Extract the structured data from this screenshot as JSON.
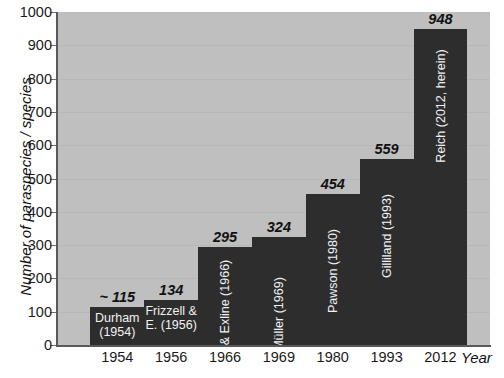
{
  "chart_data": {
    "type": "bar",
    "title": "",
    "xlabel": "Year",
    "ylabel": "Number of paraspecies / species",
    "categories": [
      "1954",
      "1956",
      "1966",
      "1969",
      "1980",
      "1993",
      "2012"
    ],
    "values": [
      115,
      134,
      295,
      324,
      454,
      559,
      948
    ],
    "value_labels": [
      "~ 115",
      "134",
      "295",
      "324",
      "454",
      "559",
      "948"
    ],
    "bar_labels": [
      "Durham (1954)",
      "Frizzell & E. (1956)",
      "Frizzell & Exline (1966)",
      "Müller (1969)",
      "Pawson (1980)",
      "Gilliland (1993)",
      "Reich (2012, herein)"
    ],
    "bar_label_lines": [
      [
        "Durham",
        "(1954)"
      ],
      [
        "Frizzell &",
        "E. (1956)"
      ],
      [
        "Frizzell & Exline",
        "(1966)"
      ],
      [
        "Müller (1969)"
      ],
      [
        "Pawson (1980)"
      ],
      [
        "Gilliland (1993)"
      ],
      [
        "Reich (2012, herein)"
      ]
    ],
    "bar_label_orientation": [
      "horizontal",
      "horizontal",
      "vertical",
      "vertical",
      "vertical",
      "vertical",
      "vertical"
    ],
    "ylim": [
      0,
      1000
    ],
    "yticks": [
      0,
      100,
      200,
      300,
      400,
      500,
      600,
      700,
      800,
      900,
      1000
    ],
    "ytick_labels": [
      "0",
      "100",
      "200",
      "300",
      "400",
      "500",
      "600",
      "700",
      "800",
      "900",
      "1000"
    ],
    "grid": true,
    "legend": "none",
    "colors": {
      "bar": "#2d2d2d",
      "plot_background": "#bfbfbf",
      "figure_background": "#ffffff",
      "axis": "#595959",
      "gridline": "#b7b7b7",
      "text": "#1a1a1a",
      "bar_label_text": "#f2f2f2"
    }
  },
  "caption": {
    "fragment": ""
  }
}
